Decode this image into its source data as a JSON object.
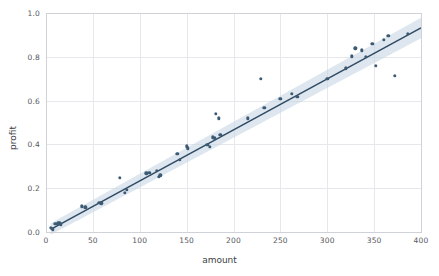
{
  "chart_data": {
    "type": "scatter",
    "title": "",
    "xlabel": "amount",
    "ylabel": "profit",
    "xlim": [
      0,
      400
    ],
    "ylim": [
      0.0,
      1.0
    ],
    "grid": true,
    "legend": "none",
    "xticks": [
      0,
      50,
      100,
      150,
      200,
      250,
      300,
      350,
      400
    ],
    "xtick_labels": [
      "0",
      "50",
      "100",
      "150",
      "200",
      "250",
      "300",
      "350",
      "400"
    ],
    "yticks": [
      0.0,
      0.2,
      0.4,
      0.6,
      0.8,
      1.0
    ],
    "ytick_labels": [
      "0.0",
      "0.2",
      "0.4",
      "0.6",
      "0.8",
      "1.0"
    ],
    "marker_color": "#3d5a73",
    "line_color": "#2f4a63",
    "band_color": "#c3d4e2",
    "grid_color": "#e6e8ec",
    "background": "#ffffff",
    "regression": {
      "slope": 0.00234,
      "intercept": 0.0,
      "x_start": 5,
      "y_start": 0.012,
      "x_end": 400,
      "y_end": 0.932,
      "ci_lower_start": -0.012,
      "ci_upper_start": 0.04,
      "ci_lower_end": 0.885,
      "ci_upper_end": 0.978
    },
    "points": [
      {
        "x": 5,
        "y": 0.02
      },
      {
        "x": 7,
        "y": 0.012
      },
      {
        "x": 10,
        "y": 0.038
      },
      {
        "x": 13,
        "y": 0.04
      },
      {
        "x": 15,
        "y": 0.043
      },
      {
        "x": 16,
        "y": 0.036
      },
      {
        "x": 38,
        "y": 0.118
      },
      {
        "x": 42,
        "y": 0.113
      },
      {
        "x": 57,
        "y": 0.133
      },
      {
        "x": 59,
        "y": 0.131
      },
      {
        "x": 79,
        "y": 0.248
      },
      {
        "x": 84,
        "y": 0.178
      },
      {
        "x": 86,
        "y": 0.192
      },
      {
        "x": 107,
        "y": 0.268
      },
      {
        "x": 110,
        "y": 0.27
      },
      {
        "x": 118,
        "y": 0.28
      },
      {
        "x": 120,
        "y": 0.252
      },
      {
        "x": 122,
        "y": 0.258
      },
      {
        "x": 140,
        "y": 0.358
      },
      {
        "x": 143,
        "y": 0.33
      },
      {
        "x": 150,
        "y": 0.392
      },
      {
        "x": 151,
        "y": 0.382
      },
      {
        "x": 172,
        "y": 0.398
      },
      {
        "x": 175,
        "y": 0.39
      },
      {
        "x": 178,
        "y": 0.432
      },
      {
        "x": 180,
        "y": 0.428
      },
      {
        "x": 181,
        "y": 0.54
      },
      {
        "x": 184,
        "y": 0.52
      },
      {
        "x": 186,
        "y": 0.445
      },
      {
        "x": 215,
        "y": 0.52
      },
      {
        "x": 229,
        "y": 0.7
      },
      {
        "x": 233,
        "y": 0.568
      },
      {
        "x": 250,
        "y": 0.608
      },
      {
        "x": 262,
        "y": 0.632
      },
      {
        "x": 268,
        "y": 0.618
      },
      {
        "x": 300,
        "y": 0.7
      },
      {
        "x": 320,
        "y": 0.748
      },
      {
        "x": 326,
        "y": 0.802
      },
      {
        "x": 330,
        "y": 0.838
      },
      {
        "x": 337,
        "y": 0.83
      },
      {
        "x": 341,
        "y": 0.8
      },
      {
        "x": 348,
        "y": 0.858
      },
      {
        "x": 352,
        "y": 0.76
      },
      {
        "x": 360,
        "y": 0.878
      },
      {
        "x": 365,
        "y": 0.895
      },
      {
        "x": 372,
        "y": 0.712
      },
      {
        "x": 386,
        "y": 0.905
      }
    ]
  }
}
